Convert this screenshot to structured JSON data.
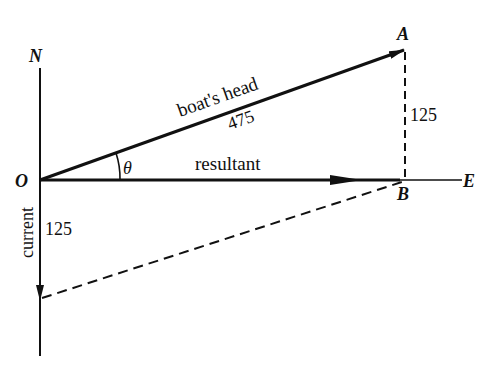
{
  "diagram": {
    "type": "vector-diagram",
    "points": {
      "origin": "O",
      "north": "N",
      "east": "E",
      "tip_a": "A",
      "tip_b": "B"
    },
    "angle_label": "θ",
    "vectors": {
      "boats_head": {
        "label": "boat's head",
        "magnitude": "475"
      },
      "resultant": {
        "label": "resultant"
      },
      "current": {
        "label": "current",
        "magnitude": "125"
      },
      "ab": {
        "magnitude": "125"
      }
    },
    "colors": {
      "ink": "#111111",
      "background": "#ffffff"
    }
  }
}
